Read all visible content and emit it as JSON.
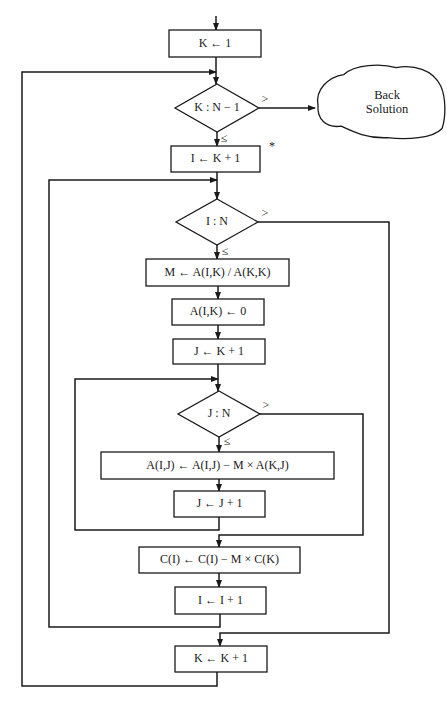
{
  "diagram": {
    "stroke_color": "#1a1a1a",
    "background": "#ffffff",
    "nodes": [
      {
        "id": "k-init",
        "type": "process",
        "label": "K ← 1",
        "x": 169,
        "y": 30,
        "w": 92,
        "h": 27
      },
      {
        "id": "k-test",
        "type": "decision",
        "label": "K : N − 1",
        "cx": 217,
        "cy": 108,
        "hw": 42,
        "hh": 24
      },
      {
        "id": "back-solve",
        "type": "terminal-cloud",
        "label": "Back\nSolution",
        "x": 315,
        "y": 63,
        "w": 131,
        "h": 77
      },
      {
        "id": "i-init",
        "type": "process",
        "label": "I ← K + 1",
        "x": 171,
        "y": 146,
        "w": 89,
        "h": 26
      },
      {
        "id": "i-test",
        "type": "decision",
        "label": "I : N",
        "cx": 217,
        "cy": 222,
        "hw": 41,
        "hh": 23
      },
      {
        "id": "m-calc",
        "type": "process",
        "label": "M ← A(I,K) / A(K,K)",
        "x": 146,
        "y": 259,
        "w": 143,
        "h": 27
      },
      {
        "id": "aik-zero",
        "type": "process",
        "label": "A(I,K) ← 0",
        "x": 172,
        "y": 299,
        "w": 92,
        "h": 26
      },
      {
        "id": "j-init",
        "type": "process",
        "label": "J ← K + 1",
        "x": 173,
        "y": 339,
        "w": 92,
        "h": 25
      },
      {
        "id": "j-test",
        "type": "decision",
        "label": "J : N",
        "cx": 219,
        "cy": 414,
        "hw": 41,
        "hh": 23
      },
      {
        "id": "aij-update",
        "type": "process",
        "label": "A(I,J) ← A(I,J) − M × A(K,J)",
        "x": 101,
        "y": 452,
        "w": 233,
        "h": 27
      },
      {
        "id": "j-incr",
        "type": "process",
        "label": "J ← J + 1",
        "x": 174,
        "y": 491,
        "w": 91,
        "h": 26
      },
      {
        "id": "c-update",
        "type": "process",
        "label": "C(I) ← C(I) − M × C(K)",
        "x": 139,
        "y": 547,
        "w": 161,
        "h": 26
      },
      {
        "id": "i-incr",
        "type": "process",
        "label": "I ← I + 1",
        "x": 175,
        "y": 587,
        "w": 91,
        "h": 27
      },
      {
        "id": "k-incr",
        "type": "process",
        "label": "K ← K + 1",
        "x": 175,
        "y": 646,
        "w": 92,
        "h": 26
      }
    ],
    "branch_labels": [
      {
        "id": "k-test-gt",
        "text": ">",
        "x": 265,
        "y": 99
      },
      {
        "id": "k-test-le",
        "text": "≤",
        "x": 224,
        "y": 138
      },
      {
        "id": "i-test-gt",
        "text": ">",
        "x": 265,
        "y": 213
      },
      {
        "id": "i-test-le",
        "text": "≤",
        "x": 225,
        "y": 251
      },
      {
        "id": "j-test-gt",
        "text": ">",
        "x": 266,
        "y": 405
      },
      {
        "id": "j-test-le",
        "text": "≤",
        "x": 227,
        "y": 441
      }
    ],
    "annotation": {
      "text": "*",
      "x": 272,
      "y": 146
    },
    "edges": [
      {
        "id": "entry",
        "points": [
          [
            216,
            16
          ],
          [
            216,
            30
          ]
        ],
        "arrow": true
      },
      {
        "id": "kinit-to-ktest",
        "points": [
          [
            216,
            57
          ],
          [
            216,
            84
          ]
        ],
        "arrow": true
      },
      {
        "id": "outer-loop-back",
        "points": [
          [
            217,
            672
          ],
          [
            217,
            686
          ],
          [
            22,
            686
          ],
          [
            22,
            72
          ],
          [
            216,
            72
          ]
        ],
        "arrow": true
      },
      {
        "id": "ktest-gt-back",
        "points": [
          [
            259,
            108
          ],
          [
            315,
            108
          ]
        ],
        "arrow": true
      },
      {
        "id": "ktest-le-iinit",
        "points": [
          [
            217,
            132
          ],
          [
            217,
            146
          ]
        ],
        "arrow": true
      },
      {
        "id": "iinit-to-itest",
        "points": [
          [
            217,
            172
          ],
          [
            217,
            199
          ]
        ],
        "arrow": true
      },
      {
        "id": "middle-loop-back",
        "points": [
          [
            220,
            614
          ],
          [
            220,
            627
          ],
          [
            49,
            627
          ],
          [
            49,
            180
          ],
          [
            217,
            180
          ]
        ],
        "arrow": true
      },
      {
        "id": "itest-le-m",
        "points": [
          [
            217,
            245
          ],
          [
            217,
            259
          ]
        ],
        "arrow": true
      },
      {
        "id": "itest-gt-kincr",
        "points": [
          [
            258,
            222
          ],
          [
            389,
            222
          ],
          [
            389,
            633
          ],
          [
            220,
            633
          ],
          [
            220,
            646
          ]
        ],
        "arrow": true
      },
      {
        "id": "m-to-aik",
        "points": [
          [
            218,
            286
          ],
          [
            218,
            299
          ]
        ],
        "arrow": true
      },
      {
        "id": "aik-to-jinit",
        "points": [
          [
            218,
            325
          ],
          [
            218,
            339
          ]
        ],
        "arrow": true
      },
      {
        "id": "jinit-to-jtest",
        "points": [
          [
            218,
            364
          ],
          [
            218,
            391
          ]
        ],
        "arrow": true
      },
      {
        "id": "inner-loop-back",
        "points": [
          [
            219,
            517
          ],
          [
            219,
            530
          ],
          [
            75,
            530
          ],
          [
            75,
            379
          ],
          [
            218,
            379
          ]
        ],
        "arrow": true
      },
      {
        "id": "jtest-le-aij",
        "points": [
          [
            219,
            437
          ],
          [
            219,
            452
          ]
        ],
        "arrow": true
      },
      {
        "id": "jtest-gt-c",
        "points": [
          [
            260,
            414
          ],
          [
            363,
            414
          ],
          [
            363,
            535
          ],
          [
            219,
            535
          ],
          [
            219,
            547
          ]
        ],
        "arrow": true
      },
      {
        "id": "aij-to-jincr",
        "points": [
          [
            219,
            479
          ],
          [
            219,
            491
          ]
        ],
        "arrow": true
      },
      {
        "id": "c-to-iincr",
        "points": [
          [
            219,
            573
          ],
          [
            219,
            587
          ]
        ],
        "arrow": true
      }
    ]
  }
}
